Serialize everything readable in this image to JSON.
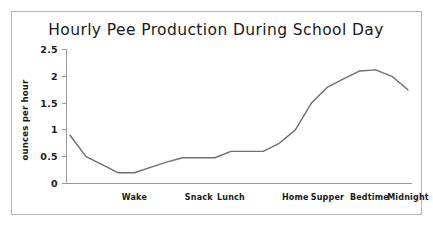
{
  "figure": {
    "border_color": "#b4b4b4",
    "background": "#ffffff"
  },
  "chart_data": {
    "type": "line",
    "title": "Hourly Pee Production During School Day",
    "xlabel": "",
    "ylabel": "ounces per hour",
    "ylim": [
      0,
      2.5
    ],
    "ytick_labels": [
      "0",
      "0.5",
      "1",
      "1.5",
      "2",
      "2.5"
    ],
    "ytick_values": [
      0,
      0.5,
      1,
      1.5,
      2,
      2.5
    ],
    "grid": false,
    "legend": "none",
    "line_color": "#6e6e6e",
    "x": [
      0,
      1,
      2,
      3,
      4,
      5,
      6,
      7,
      8,
      9,
      10,
      11,
      12,
      13,
      14,
      15,
      16,
      17,
      18,
      19,
      20,
      21
    ],
    "xtick_labels": [
      "Wake",
      "Snack",
      "Lunch",
      "Home",
      "Supper",
      "Bedtime",
      "Midnight"
    ],
    "xtick_positions": [
      4,
      8,
      10,
      14,
      16,
      18.6,
      21
    ],
    "series": [
      {
        "name": "ounces per hour",
        "values": [
          0.9,
          0.5,
          0.35,
          0.2,
          0.2,
          0.3,
          0.4,
          0.48,
          0.48,
          0.48,
          0.6,
          0.6,
          0.6,
          0.75,
          1.0,
          1.5,
          1.8,
          1.95,
          2.1,
          2.12,
          2.0,
          1.75
        ]
      }
    ]
  }
}
